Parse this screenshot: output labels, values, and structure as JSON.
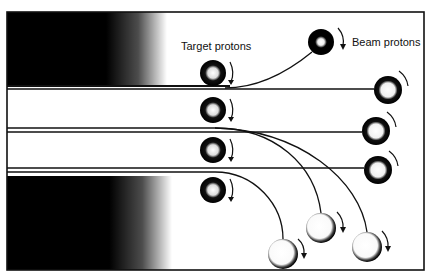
{
  "labels": {
    "target": "Target protons",
    "beam": "Beam protons"
  },
  "colors": {
    "ink": "#111111",
    "paper": "#ffffff"
  },
  "frame": {
    "x": 7,
    "y": 12,
    "width": 417,
    "height": 258
  },
  "target_protons": [
    {
      "cx": 213,
      "cy": 73,
      "r": 13
    },
    {
      "cx": 213,
      "cy": 110,
      "r": 13
    },
    {
      "cx": 213,
      "cy": 150,
      "r": 13
    },
    {
      "cx": 213,
      "cy": 190,
      "r": 13
    }
  ],
  "beam_protons": [
    {
      "cx": 321,
      "cy": 42,
      "r": 13,
      "style": "dark"
    },
    {
      "cx": 388,
      "cy": 90,
      "r": 14,
      "style": "ring"
    },
    {
      "cx": 376,
      "cy": 131,
      "r": 14,
      "style": "ring"
    },
    {
      "cx": 378,
      "cy": 170,
      "r": 14,
      "style": "ring"
    },
    {
      "cx": 321,
      "cy": 228,
      "r": 15,
      "style": "light"
    },
    {
      "cx": 367,
      "cy": 247,
      "r": 15,
      "style": "light"
    },
    {
      "cx": 283,
      "cy": 254,
      "r": 15,
      "style": "light"
    }
  ]
}
